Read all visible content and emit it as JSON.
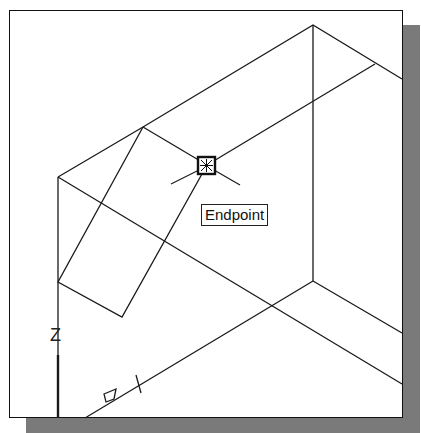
{
  "viewport": {
    "title": "3D wireframe drawing viewport",
    "background": "#ffffff",
    "line_color": "#1a1a1a",
    "shadow_color": "#7a7a7a"
  },
  "osnap": {
    "tooltip": "Endpoint",
    "marker_icon": "endpoint-snap-marker",
    "marker_position": [
      207,
      165
    ]
  },
  "ucs_icon": {
    "z_label": "Z",
    "icon": "ucs-axis-icon"
  }
}
